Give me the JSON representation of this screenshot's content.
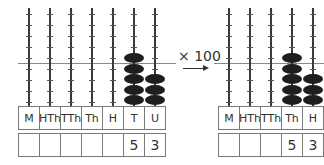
{
  "operation": {
    "label": "× 100",
    "arrow": "right-arrow"
  },
  "left_abacus": {
    "columns": [
      "M",
      "HTh",
      "TTh",
      "Th",
      "H",
      "T",
      "U"
    ],
    "values": [
      "",
      "",
      "",
      "",
      "",
      "5",
      "3"
    ],
    "beads": [
      0,
      0,
      0,
      0,
      0,
      5,
      3
    ]
  },
  "right_abacus": {
    "columns": [
      "M",
      "HTh",
      "TTh",
      "Th",
      "H"
    ],
    "values": [
      "",
      "",
      "",
      "5",
      "3"
    ],
    "beads": [
      0,
      0,
      0,
      5,
      3
    ]
  },
  "colors": {
    "bead": "#1e1e1e",
    "rod": "#3a3a3a",
    "border": "#7a7a7a"
  }
}
